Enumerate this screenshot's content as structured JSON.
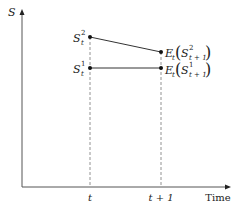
{
  "diagram": {
    "y_axis_label": "S",
    "x_axis_label": "Time",
    "ticks": [
      {
        "label": "t"
      },
      {
        "label": "t + 1"
      }
    ],
    "points": {
      "s_t_2": {
        "base": "S",
        "sub": "t",
        "sup": "2"
      },
      "s_t_1": {
        "base": "S",
        "sub": "t",
        "sup": "1"
      },
      "e_2": {
        "op": "E",
        "op_sub": "t",
        "base": "S",
        "sub": "t + 1",
        "sup": "2"
      },
      "e_1": {
        "op": "E",
        "op_sub": "t",
        "base": "S",
        "sub": "t + 1",
        "sup": "1"
      }
    },
    "colors": {
      "axis": "#555555",
      "line": "#333333",
      "dashed": "#777777",
      "point": "#111111"
    }
  }
}
